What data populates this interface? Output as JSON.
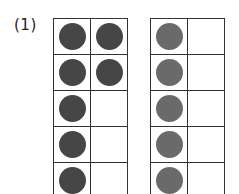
{
  "problem": {
    "label": "(1)"
  },
  "frames": [
    {
      "name": "ten-frame-left",
      "dot_color": "#464646",
      "cells": [
        1,
        1,
        1,
        1,
        1,
        0,
        1,
        0,
        1,
        0
      ]
    },
    {
      "name": "ten-frame-right",
      "dot_color": "#6a6a6a",
      "cells": [
        1,
        0,
        1,
        0,
        1,
        0,
        1,
        0,
        1,
        0
      ]
    }
  ]
}
